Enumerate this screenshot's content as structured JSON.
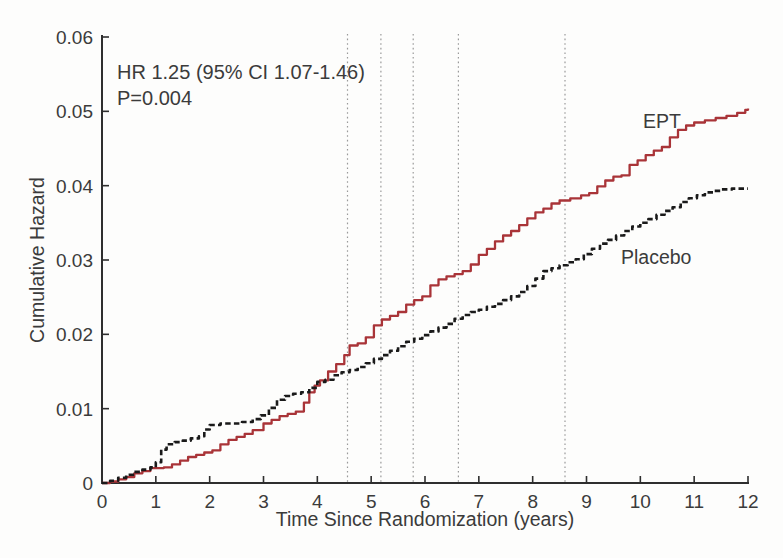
{
  "figure": {
    "background": "#fdfdfc"
  },
  "chart_data": {
    "type": "line",
    "title": "",
    "xlabel": "Time Since Randomization (years)",
    "ylabel": "Cumulative Hazard",
    "xlim": [
      0,
      12
    ],
    "ylim": [
      0,
      0.06
    ],
    "grid": false,
    "legend_position": "inline-labels-on-curves",
    "x_ticks": [
      0,
      1,
      2,
      3,
      4,
      5,
      6,
      7,
      8,
      9,
      10,
      11,
      12
    ],
    "x_tick_labels": [
      "0",
      "1",
      "2",
      "3",
      "4",
      "5",
      "6",
      "7",
      "8",
      "9",
      "10",
      "11",
      "12"
    ],
    "y_ticks": [
      0,
      0.01,
      0.02,
      0.03,
      0.04,
      0.05,
      0.06
    ],
    "y_tick_labels": [
      "0",
      "0.01",
      "0.02",
      "0.03",
      "0.04",
      "0.05",
      "0.06"
    ],
    "annotation": {
      "line1": "HR 1.25 (95% CI 1.07-1.46)",
      "line2": "P=0.004"
    },
    "reference_lines_x": [
      4.56,
      5.18,
      5.78,
      6.62,
      8.6
    ],
    "colors": {
      "axis": "#2e2e2e",
      "text": "#3b3b3b",
      "reference_line": "#9a9a9a",
      "ept": "#a93438",
      "placebo": "#1a1a1a"
    },
    "series": [
      {
        "name": "EPT",
        "style": "solid",
        "color": "#a93438",
        "points": [
          [
            0,
            0
          ],
          [
            0.15,
            0.0002
          ],
          [
            0.3,
            0.0005
          ],
          [
            0.45,
            0.0008
          ],
          [
            0.6,
            0.0013
          ],
          [
            0.75,
            0.0016
          ],
          [
            0.9,
            0.002
          ],
          [
            1.15,
            0.0021
          ],
          [
            1.3,
            0.0025
          ],
          [
            1.45,
            0.003
          ],
          [
            1.6,
            0.0035
          ],
          [
            1.75,
            0.0038
          ],
          [
            1.9,
            0.0041
          ],
          [
            2.05,
            0.0044
          ],
          [
            2.2,
            0.0052
          ],
          [
            2.35,
            0.0058
          ],
          [
            2.5,
            0.0062
          ],
          [
            2.65,
            0.0066
          ],
          [
            2.8,
            0.0071
          ],
          [
            3.0,
            0.008
          ],
          [
            3.15,
            0.0085
          ],
          [
            3.3,
            0.009
          ],
          [
            3.45,
            0.0093
          ],
          [
            3.6,
            0.0096
          ],
          [
            3.75,
            0.0108
          ],
          [
            3.85,
            0.0122
          ],
          [
            3.95,
            0.0131
          ],
          [
            4.05,
            0.0138
          ],
          [
            4.2,
            0.015
          ],
          [
            4.35,
            0.016
          ],
          [
            4.5,
            0.0172
          ],
          [
            4.6,
            0.0185
          ],
          [
            4.75,
            0.0188
          ],
          [
            4.9,
            0.0196
          ],
          [
            5.05,
            0.0212
          ],
          [
            5.2,
            0.022
          ],
          [
            5.35,
            0.0225
          ],
          [
            5.5,
            0.023
          ],
          [
            5.65,
            0.024
          ],
          [
            5.8,
            0.0246
          ],
          [
            5.95,
            0.0251
          ],
          [
            6.1,
            0.0266
          ],
          [
            6.25,
            0.0274
          ],
          [
            6.4,
            0.0278
          ],
          [
            6.55,
            0.0281
          ],
          [
            6.7,
            0.0285
          ],
          [
            6.85,
            0.0294
          ],
          [
            7.0,
            0.0307
          ],
          [
            7.15,
            0.0315
          ],
          [
            7.3,
            0.0325
          ],
          [
            7.45,
            0.0333
          ],
          [
            7.6,
            0.0339
          ],
          [
            7.75,
            0.0347
          ],
          [
            7.9,
            0.0356
          ],
          [
            8.05,
            0.0364
          ],
          [
            8.2,
            0.0369
          ],
          [
            8.35,
            0.0376
          ],
          [
            8.5,
            0.038
          ],
          [
            8.7,
            0.0383
          ],
          [
            8.9,
            0.0387
          ],
          [
            9.05,
            0.039
          ],
          [
            9.2,
            0.0399
          ],
          [
            9.35,
            0.0407
          ],
          [
            9.5,
            0.0412
          ],
          [
            9.65,
            0.0414
          ],
          [
            9.8,
            0.0428
          ],
          [
            9.95,
            0.0434
          ],
          [
            10.1,
            0.0441
          ],
          [
            10.25,
            0.0447
          ],
          [
            10.4,
            0.0452
          ],
          [
            10.55,
            0.0465
          ],
          [
            10.7,
            0.0475
          ],
          [
            10.85,
            0.0481
          ],
          [
            11.0,
            0.0485
          ],
          [
            11.2,
            0.0488
          ],
          [
            11.4,
            0.0491
          ],
          [
            11.6,
            0.0494
          ],
          [
            11.8,
            0.0498
          ],
          [
            11.95,
            0.0502
          ],
          [
            12,
            0.0504
          ]
        ]
      },
      {
        "name": "Placebo",
        "style": "dashed",
        "color": "#1a1a1a",
        "points": [
          [
            0,
            0
          ],
          [
            0.15,
            0.0003
          ],
          [
            0.3,
            0.0007
          ],
          [
            0.45,
            0.0011
          ],
          [
            0.6,
            0.0015
          ],
          [
            0.75,
            0.0018
          ],
          [
            0.9,
            0.0021
          ],
          [
            1.0,
            0.0028
          ],
          [
            1.1,
            0.0045
          ],
          [
            1.2,
            0.0052
          ],
          [
            1.35,
            0.0055
          ],
          [
            1.5,
            0.0057
          ],
          [
            1.65,
            0.006
          ],
          [
            1.8,
            0.0063
          ],
          [
            1.9,
            0.0072
          ],
          [
            2.0,
            0.0078
          ],
          [
            2.2,
            0.008
          ],
          [
            2.4,
            0.008
          ],
          [
            2.6,
            0.0082
          ],
          [
            2.8,
            0.0086
          ],
          [
            2.95,
            0.0091
          ],
          [
            3.1,
            0.0101
          ],
          [
            3.25,
            0.0112
          ],
          [
            3.4,
            0.0117
          ],
          [
            3.55,
            0.012
          ],
          [
            3.7,
            0.0122
          ],
          [
            3.85,
            0.0128
          ],
          [
            4.0,
            0.0136
          ],
          [
            4.15,
            0.0139
          ],
          [
            4.3,
            0.0145
          ],
          [
            4.45,
            0.0149
          ],
          [
            4.6,
            0.0152
          ],
          [
            4.75,
            0.0156
          ],
          [
            4.9,
            0.0161
          ],
          [
            5.05,
            0.0167
          ],
          [
            5.2,
            0.0172
          ],
          [
            5.35,
            0.0178
          ],
          [
            5.5,
            0.0184
          ],
          [
            5.65,
            0.019
          ],
          [
            5.8,
            0.0194
          ],
          [
            5.95,
            0.0199
          ],
          [
            6.1,
            0.0204
          ],
          [
            6.25,
            0.0209
          ],
          [
            6.4,
            0.0214
          ],
          [
            6.55,
            0.0221
          ],
          [
            6.7,
            0.0226
          ],
          [
            6.85,
            0.023
          ],
          [
            7.0,
            0.0233
          ],
          [
            7.15,
            0.0237
          ],
          [
            7.3,
            0.0241
          ],
          [
            7.45,
            0.0246
          ],
          [
            7.6,
            0.0251
          ],
          [
            7.75,
            0.0257
          ],
          [
            7.9,
            0.0265
          ],
          [
            8.05,
            0.0275
          ],
          [
            8.2,
            0.0285
          ],
          [
            8.35,
            0.0289
          ],
          [
            8.5,
            0.0293
          ],
          [
            8.65,
            0.0297
          ],
          [
            8.8,
            0.0301
          ],
          [
            8.95,
            0.0308
          ],
          [
            9.1,
            0.0315
          ],
          [
            9.25,
            0.0322
          ],
          [
            9.4,
            0.0327
          ],
          [
            9.55,
            0.0333
          ],
          [
            9.7,
            0.0339
          ],
          [
            9.85,
            0.0345
          ],
          [
            10.0,
            0.035
          ],
          [
            10.15,
            0.0355
          ],
          [
            10.3,
            0.0361
          ],
          [
            10.45,
            0.0366
          ],
          [
            10.6,
            0.0371
          ],
          [
            10.75,
            0.0378
          ],
          [
            10.9,
            0.0383
          ],
          [
            11.05,
            0.0387
          ],
          [
            11.2,
            0.0391
          ],
          [
            11.35,
            0.0393
          ],
          [
            11.5,
            0.0395
          ],
          [
            11.7,
            0.0396
          ],
          [
            12,
            0.0396
          ]
        ]
      }
    ]
  }
}
